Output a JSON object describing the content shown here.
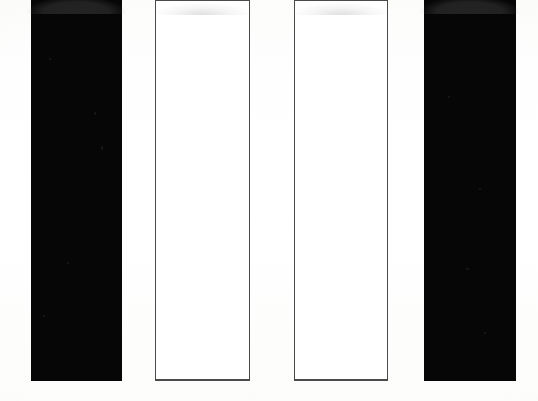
{
  "figure": {
    "width": 538,
    "height": 401,
    "background_color": "#fdfdfc",
    "title": "",
    "subtitle": ""
  },
  "style": {
    "fill_color": "#060606",
    "outline_color": "#4a4a4a",
    "empty_fill_color": "#ffffff",
    "baseline_y": 381
  },
  "chart_data": {
    "type": "bar",
    "title": "",
    "subtitle": "",
    "xlabel": "",
    "ylabel": "",
    "categories": [
      "1",
      "2",
      "3",
      "4"
    ],
    "values": [
      100,
      100,
      100,
      100
    ],
    "ylim": [
      0,
      100
    ],
    "grid": false,
    "legend": null,
    "legend_position": "none",
    "axis_visible": false,
    "tick_labels_x": [],
    "tick_labels_y": [],
    "annotations": [],
    "series": [
      {
        "name": "bars",
        "values": [
          100,
          100,
          100,
          100
        ],
        "styles": [
          "filled",
          "outlined",
          "outlined",
          "filled"
        ]
      }
    ],
    "bars": [
      {
        "index": 1,
        "label": "1",
        "style": "filled",
        "fill": "#060606",
        "x": 31,
        "y": 0,
        "width": 91,
        "height": 381,
        "value": 100
      },
      {
        "index": 2,
        "label": "2",
        "style": "outlined",
        "fill": "#ffffff",
        "x": 155,
        "y": 0,
        "width": 95,
        "height": 381,
        "value": 100
      },
      {
        "index": 3,
        "label": "3",
        "style": "outlined",
        "fill": "#ffffff",
        "x": 294,
        "y": 0,
        "width": 94,
        "height": 381,
        "value": 100
      },
      {
        "index": 4,
        "label": "4",
        "style": "filled",
        "fill": "#060606",
        "x": 424,
        "y": 0,
        "width": 92,
        "height": 381,
        "value": 100
      }
    ]
  }
}
